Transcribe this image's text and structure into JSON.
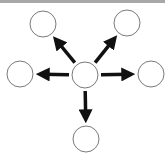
{
  "diagram": {
    "title": "",
    "colors": {
      "node_stroke": "#7a7a7a",
      "node_fill": "#ffffff",
      "arrow": "#111111",
      "topbar": "#a8a8a8"
    },
    "center": {
      "id": "center",
      "x": 85,
      "y": 75,
      "r": 13
    },
    "nodes": [
      {
        "id": "top-left",
        "x": 43,
        "y": 24,
        "r": 13
      },
      {
        "id": "top-right",
        "x": 127,
        "y": 23,
        "r": 13
      },
      {
        "id": "left",
        "x": 20,
        "y": 74,
        "r": 13
      },
      {
        "id": "right",
        "x": 151,
        "y": 74,
        "r": 13
      },
      {
        "id": "bottom",
        "x": 86,
        "y": 139,
        "r": 13
      }
    ],
    "edges": [
      {
        "from": "center",
        "to": "top-left"
      },
      {
        "from": "center",
        "to": "top-right"
      },
      {
        "from": "center",
        "to": "left"
      },
      {
        "from": "center",
        "to": "right"
      },
      {
        "from": "center",
        "to": "bottom"
      }
    ]
  }
}
